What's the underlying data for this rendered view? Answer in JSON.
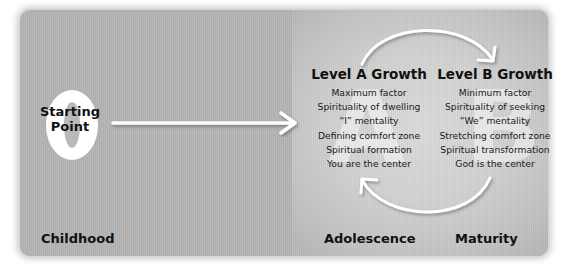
{
  "diagram": {
    "starting_point": {
      "numeral": "0",
      "label_line1": "Starting",
      "label_line2": "Point"
    },
    "level_a": {
      "watermark": "A",
      "title": "Level A Growth",
      "items": [
        "Maximum factor",
        "Spirituality of dwelling",
        "“I” mentality",
        "Defining comfort zone",
        "Spiritual formation",
        "You are the center"
      ]
    },
    "level_b": {
      "watermark": "B",
      "title": "Level B Growth",
      "items": [
        "Minimum factor",
        "Spirituality of seeking",
        "“We” mentality",
        "Stretching comfort zone",
        "Spiritual transformation",
        "God is the center"
      ]
    },
    "stages": {
      "childhood": "Childhood",
      "adolescence": "Adolescence",
      "maturity": "Maturity"
    },
    "arrows": [
      {
        "name": "start-to-level-a",
        "type": "straight"
      },
      {
        "name": "level-a-to-level-b",
        "type": "arc-top"
      },
      {
        "name": "level-b-to-level-a",
        "type": "arc-bottom"
      }
    ],
    "colors": {
      "panel": "#b4b4b4",
      "glow": "#d8d8d8",
      "arrow": "#ffffff",
      "text": "#111111"
    }
  }
}
